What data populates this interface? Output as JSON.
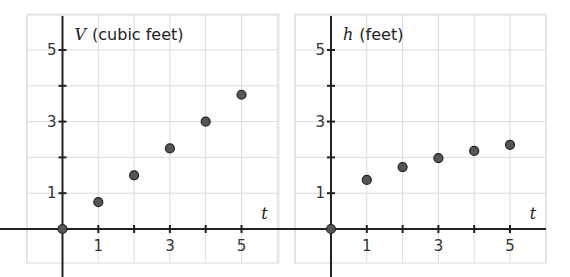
{
  "chart_data": [
    {
      "type": "scatter",
      "title": "",
      "ylabel_var": "V",
      "ylabel_unit": "(cubic feet)",
      "xlabel": "t",
      "x_ticks": [
        1,
        2,
        3,
        4,
        5
      ],
      "x_tick_labels": [
        "1",
        "3",
        "5"
      ],
      "y_ticks": [
        1,
        2,
        3,
        4,
        5
      ],
      "y_tick_labels": [
        "1",
        "3",
        "5"
      ],
      "xlim": [
        -1,
        6
      ],
      "ylim": [
        -1,
        6
      ],
      "grid": true,
      "x": [
        0,
        1,
        2,
        3,
        4,
        5
      ],
      "values": [
        0,
        0.75,
        1.5,
        2.25,
        3.0,
        3.75
      ]
    },
    {
      "type": "scatter",
      "title": "",
      "ylabel_var": "h",
      "ylabel_unit": "(feet)",
      "xlabel": "t",
      "x_ticks": [
        1,
        2,
        3,
        4,
        5
      ],
      "x_tick_labels": [
        "1",
        "3",
        "5"
      ],
      "y_ticks": [
        1,
        2,
        3,
        4,
        5
      ],
      "y_tick_labels": [
        "1",
        "3",
        "5"
      ],
      "xlim": [
        -1,
        6
      ],
      "ylim": [
        -1,
        6
      ],
      "grid": true,
      "x": [
        0,
        1,
        2,
        3,
        4,
        5
      ],
      "values": [
        0,
        1.37,
        1.73,
        1.98,
        2.18,
        2.35
      ]
    }
  ],
  "style": {
    "grid_color": "#dcdcdc",
    "axis_color": "#222222",
    "point_fill": "#555555",
    "point_stroke": "#222222"
  }
}
